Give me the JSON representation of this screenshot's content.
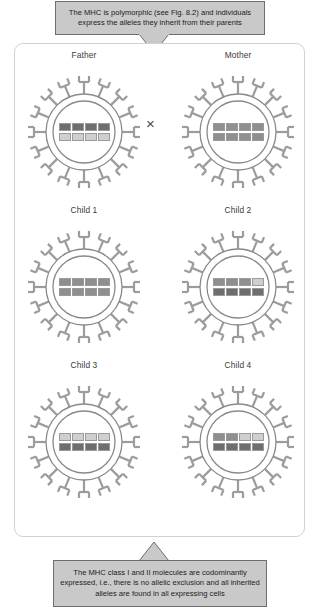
{
  "figure": {
    "caption_top": "The MHC is polymorphic (see Fig. 8.2) and individuals express the alleles they inherit from their parents",
    "caption_bottom": "The MHC class I and II molecules are codominantly expressed, i.e., there is no allelic exclusion and all inherited alleles are found in all expressing cells",
    "cross_symbol": "×"
  },
  "palette": {
    "dark": "#6e6e6e",
    "medium": "#8f8f8f",
    "light": "#cfcfcf",
    "outline": "#9a9a9a",
    "receptor": "#9c9c9c",
    "membrane": "#8a8a8a",
    "caption_bg": "#c9c9c9",
    "caption_border": "#6f6f6f",
    "frame_border": "#d2d2d2"
  },
  "cells": [
    {
      "label": "Father",
      "receptor_count": 16,
      "alleles_top": [
        "dark",
        "dark",
        "dark",
        "dark"
      ],
      "alleles_bottom": [
        "light",
        "light",
        "light",
        "light"
      ]
    },
    {
      "label": "Mother",
      "receptor_count": 16,
      "alleles_top": [
        "medium",
        "medium",
        "medium",
        "medium"
      ],
      "alleles_bottom": [
        "medium",
        "medium",
        "medium",
        "medium"
      ]
    },
    {
      "label": "Child 1",
      "receptor_count": 16,
      "alleles_top": [
        "medium",
        "medium",
        "medium",
        "medium"
      ],
      "alleles_bottom": [
        "medium",
        "medium",
        "medium",
        "medium"
      ]
    },
    {
      "label": "Child 2",
      "receptor_count": 16,
      "alleles_top": [
        "medium",
        "medium",
        "medium",
        "light"
      ],
      "alleles_bottom": [
        "dark",
        "dark",
        "dark",
        "dark"
      ]
    },
    {
      "label": "Child 3",
      "receptor_count": 16,
      "alleles_top": [
        "light",
        "light",
        "light",
        "light"
      ],
      "alleles_bottom": [
        "dark",
        "dark",
        "dark",
        "dark"
      ]
    },
    {
      "label": "Child 4",
      "receptor_count": 16,
      "alleles_top": [
        "medium",
        "medium",
        "light",
        "light"
      ],
      "alleles_bottom": [
        "dark",
        "dark",
        "dark",
        "dark"
      ]
    }
  ]
}
